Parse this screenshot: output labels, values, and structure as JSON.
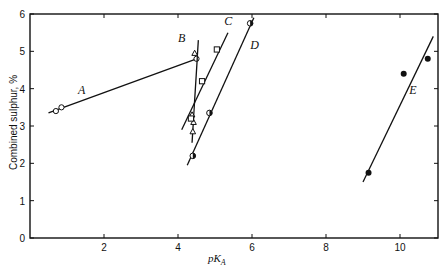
{
  "chart_data": {
    "type": "scatter",
    "title": "",
    "xlabel": "pK_A",
    "ylabel": "Combined sulphur, %",
    "xlim": [
      0,
      11
    ],
    "ylim": [
      0,
      6
    ],
    "xticks": [
      2,
      4,
      6,
      8,
      10
    ],
    "yticks": [
      0,
      1,
      2,
      3,
      4,
      5,
      6
    ],
    "grid": false,
    "legend": "inline letter labels",
    "series": [
      {
        "name": "A",
        "marker": "open-circle",
        "points": [
          [
            0.7,
            3.4
          ],
          [
            0.85,
            3.5
          ],
          [
            4.5,
            4.8
          ]
        ],
        "fit_line": [
          [
            0.5,
            3.35
          ],
          [
            4.5,
            4.8
          ]
        ],
        "label_pos": [
          1.3,
          3.85
        ]
      },
      {
        "name": "B",
        "marker": "open-triangle",
        "points": [
          [
            4.45,
            4.95
          ],
          [
            4.38,
            3.3
          ],
          [
            4.42,
            3.1
          ],
          [
            4.4,
            2.85
          ]
        ],
        "fit_line": [
          [
            4.38,
            2.55
          ],
          [
            4.55,
            5.3
          ]
        ],
        "label_pos": [
          4.0,
          5.25
        ]
      },
      {
        "name": "C",
        "marker": "open-square",
        "points": [
          [
            4.35,
            3.2
          ],
          [
            4.65,
            4.2
          ],
          [
            5.05,
            5.05
          ]
        ],
        "fit_line": [
          [
            4.1,
            2.9
          ],
          [
            5.35,
            5.5
          ]
        ],
        "label_pos": [
          5.25,
          5.7
        ]
      },
      {
        "name": "D",
        "marker": "half-filled-circle",
        "points": [
          [
            4.4,
            2.2
          ],
          [
            4.85,
            3.35
          ],
          [
            5.95,
            5.75
          ]
        ],
        "fit_line": [
          [
            4.25,
            1.95
          ],
          [
            6.05,
            5.9
          ]
        ],
        "label_pos": [
          5.95,
          5.05
        ]
      },
      {
        "name": "E",
        "marker": "filled-circle",
        "points": [
          [
            9.15,
            1.75
          ],
          [
            10.1,
            4.4
          ],
          [
            10.75,
            4.8
          ]
        ],
        "fit_line": [
          [
            9.0,
            1.5
          ],
          [
            10.9,
            5.4
          ]
        ],
        "label_pos": [
          10.25,
          3.85
        ]
      }
    ]
  },
  "axis": {
    "x_title_main": "pK",
    "x_title_sub": "A",
    "y_title": "Combined sulphur, %"
  }
}
